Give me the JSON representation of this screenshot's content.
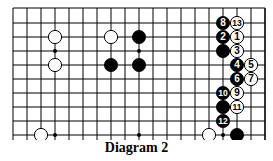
{
  "caption": "Diagram 2",
  "board": {
    "columns": 19,
    "rows": 10,
    "origin_x": 13,
    "origin_y": 9,
    "spacing": 14,
    "line_color": "#000000",
    "right_edge": true,
    "bottom_extends": true
  },
  "star_points": [
    {
      "col": 3,
      "row": 3
    },
    {
      "col": 9,
      "row": 3
    },
    {
      "col": 3,
      "row": 9
    },
    {
      "col": 9,
      "row": 9
    },
    {
      "col": 15,
      "row": 9
    }
  ],
  "stones": [
    {
      "color": "white",
      "col": 3,
      "row": 2,
      "label": ""
    },
    {
      "color": "white",
      "col": 3,
      "row": 4,
      "label": ""
    },
    {
      "color": "white",
      "col": 7,
      "row": 2,
      "label": ""
    },
    {
      "color": "black",
      "col": 9,
      "row": 2,
      "label": ""
    },
    {
      "color": "black",
      "col": 7,
      "row": 4,
      "label": ""
    },
    {
      "color": "black",
      "col": 9,
      "row": 4,
      "label": ""
    },
    {
      "color": "white",
      "col": 2,
      "row": 9,
      "label": ""
    },
    {
      "color": "white",
      "col": 14,
      "row": 9,
      "label": ""
    },
    {
      "color": "black",
      "col": 16,
      "row": 9,
      "label": ""
    },
    {
      "color": "black",
      "col": 15,
      "row": 1,
      "label": "8"
    },
    {
      "color": "white",
      "col": 16,
      "row": 1,
      "label": "13"
    },
    {
      "color": "black",
      "col": 15,
      "row": 2,
      "label": "2"
    },
    {
      "color": "white",
      "col": 16,
      "row": 2,
      "label": "1"
    },
    {
      "color": "black",
      "col": 15,
      "row": 3,
      "label": ""
    },
    {
      "color": "white",
      "col": 16,
      "row": 3,
      "label": "3"
    },
    {
      "color": "black",
      "col": 16,
      "row": 4,
      "label": "4"
    },
    {
      "color": "white",
      "col": 17,
      "row": 4,
      "label": "5"
    },
    {
      "color": "black",
      "col": 16,
      "row": 5,
      "label": "6"
    },
    {
      "color": "white",
      "col": 17,
      "row": 5,
      "label": "7"
    },
    {
      "color": "black",
      "col": 15,
      "row": 6,
      "label": "10"
    },
    {
      "color": "white",
      "col": 16,
      "row": 6,
      "label": "9"
    },
    {
      "color": "black",
      "col": 15,
      "row": 7,
      "label": ""
    },
    {
      "color": "white",
      "col": 16,
      "row": 7,
      "label": "11"
    },
    {
      "color": "black",
      "col": 15,
      "row": 8,
      "label": "12"
    }
  ]
}
